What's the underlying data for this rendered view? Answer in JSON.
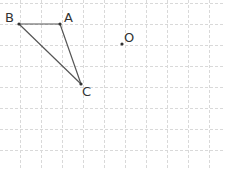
{
  "diagram": {
    "grid": {
      "spacing": 21,
      "offset_x": -1,
      "offset_y": 3,
      "color": "#d9d9d9",
      "style": "dashed"
    },
    "points": [
      {
        "id": "A",
        "label": "A",
        "x": 60,
        "y": 24,
        "lx": 64,
        "ly": 22
      },
      {
        "id": "B",
        "label": "B",
        "x": 19,
        "y": 24,
        "lx": 5,
        "ly": 22
      },
      {
        "id": "C",
        "label": "C",
        "x": 81,
        "y": 84,
        "lx": 82,
        "ly": 96
      },
      {
        "id": "O",
        "label": "O",
        "x": 122,
        "y": 44,
        "lx": 124,
        "ly": 42
      }
    ],
    "segments": [
      {
        "from": "B",
        "to": "A"
      },
      {
        "from": "A",
        "to": "C"
      },
      {
        "from": "B",
        "to": "C"
      }
    ]
  }
}
